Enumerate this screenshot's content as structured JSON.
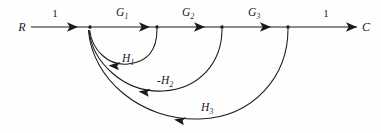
{
  "figure": {
    "type": "signal-flow-graph",
    "background_color": "#fefefe",
    "stroke_color": "#1a1a1a",
    "width": 381,
    "height": 133
  },
  "terminals": {
    "input_label": "R",
    "output_label": "C"
  },
  "nodes": [
    {
      "id": "R",
      "label": "R",
      "x": 22,
      "y": 27,
      "kind": "source",
      "dot": false
    },
    {
      "id": "n1",
      "label": "",
      "x": 90,
      "y": 27,
      "kind": "summing",
      "dot": true
    },
    {
      "id": "n2",
      "label": "",
      "x": 157,
      "y": 27,
      "kind": "mixed",
      "dot": true
    },
    {
      "id": "n3",
      "label": "",
      "x": 222,
      "y": 27,
      "kind": "mixed",
      "dot": true
    },
    {
      "id": "n4",
      "label": "",
      "x": 288,
      "y": 27,
      "kind": "mixed",
      "dot": true
    },
    {
      "id": "C",
      "label": "C",
      "x": 366,
      "y": 27,
      "kind": "sink",
      "dot": false
    }
  ],
  "forward_branches": [
    {
      "id": "b-r-n1",
      "gain": "1",
      "from": "R",
      "to": "n1",
      "label_x": 55,
      "label_y": 13,
      "subscript": ""
    },
    {
      "id": "b-n1-n2",
      "gain": "G",
      "from": "n1",
      "to": "n2",
      "label_x": 122,
      "label_y": 13,
      "subscript": "1"
    },
    {
      "id": "b-n2-n3",
      "gain": "G",
      "from": "n2",
      "to": "n3",
      "label_x": 188,
      "label_y": 13,
      "subscript": "2"
    },
    {
      "id": "b-n3-n4",
      "gain": "G",
      "from": "n3",
      "to": "n4",
      "label_x": 254,
      "label_y": 13,
      "subscript": "3"
    },
    {
      "id": "b-n4-c",
      "gain": "1",
      "from": "n4",
      "to": "C",
      "label_x": 326,
      "label_y": 13,
      "subscript": ""
    }
  ],
  "feedback_branches": [
    {
      "id": "fb-h1",
      "gain": "H",
      "subscript": "1",
      "sign": "",
      "from": "n2",
      "to": "n1",
      "label_x": 128,
      "label_y": 59,
      "depth": 31,
      "arrow_direction": "left"
    },
    {
      "id": "fb-h2",
      "gain": "H",
      "subscript": "2",
      "sign": "-",
      "from": "n3",
      "to": "n1",
      "label_x": 165,
      "label_y": 81,
      "depth": 65,
      "arrow_direction": "left"
    },
    {
      "id": "fb-h3",
      "gain": "H",
      "subscript": "3",
      "sign": "",
      "from": "n4",
      "to": "n1",
      "label_x": 207,
      "label_y": 108,
      "depth": 93,
      "arrow_direction": "left"
    }
  ]
}
